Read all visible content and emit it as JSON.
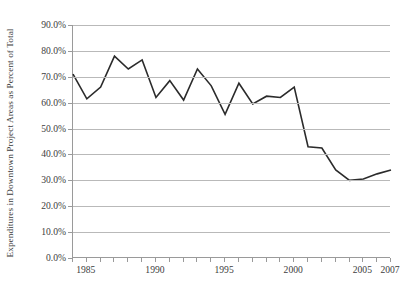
{
  "chart_data": {
    "type": "line",
    "title": "",
    "xlabel": "",
    "ylabel": "Expenditures in Downtown Project Areas as Percent of Total",
    "x": [
      1984,
      1985,
      1986,
      1987,
      1988,
      1989,
      1990,
      1991,
      1992,
      1993,
      1994,
      1995,
      1996,
      1997,
      1998,
      1999,
      2000,
      2001,
      2002,
      2003,
      2004,
      2005,
      2006,
      2007
    ],
    "values": [
      71.0,
      61.5,
      66.0,
      78.0,
      73.0,
      76.5,
      62.0,
      68.5,
      61.0,
      73.0,
      66.5,
      55.5,
      67.5,
      59.5,
      62.5,
      62.0,
      66.0,
      43.0,
      42.5,
      34.0,
      30.0,
      30.5,
      32.5,
      34.0
    ],
    "series": [
      {
        "name": "Expenditures in Downtown Project Areas as Percent of Total",
        "values": [
          71.0,
          61.5,
          66.0,
          78.0,
          73.0,
          76.5,
          62.0,
          68.5,
          61.0,
          73.0,
          66.5,
          55.5,
          67.5,
          59.5,
          62.5,
          62.0,
          66.0,
          43.0,
          42.5,
          34.0,
          30.0,
          30.5,
          32.5,
          34.0
        ]
      }
    ],
    "ylim": [
      0,
      90
    ],
    "xlim": [
      1984,
      2007
    ],
    "y_ticks": [
      0,
      10,
      20,
      30,
      40,
      50,
      60,
      70,
      80,
      90
    ],
    "y_tick_labels": [
      "0.0%",
      "10.0%",
      "20.0%",
      "30.0%",
      "40.0%",
      "50.0%",
      "60.0%",
      "70.0%",
      "80.0%",
      "90.0%"
    ],
    "x_tick_labels": [
      "1985",
      "1990",
      "1995",
      "2000",
      "2005",
      "2007"
    ],
    "x_tick_label_values": [
      1985,
      1990,
      1995,
      2000,
      2005,
      2007
    ],
    "grid": true,
    "legend": "none",
    "line_color": "#2b2b2b",
    "grid_color": "#b9b9b9",
    "axis_color": "#9a9a9a",
    "background_color": "#ffffff"
  }
}
